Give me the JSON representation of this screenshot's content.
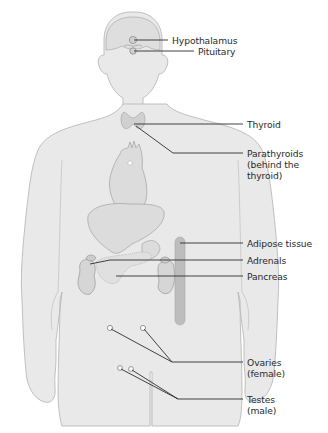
{
  "diagram": {
    "type": "anatomical-diagram",
    "colors": {
      "background": "#ffffff",
      "body_fill": "#e9e9e9",
      "body_stroke": "#b9b9b9",
      "organ_fill": "#d7d7d7",
      "organ_stroke": "#a5a5a5",
      "gland_fill": "#cfcfcf",
      "adipose_fill": "#bdbdbd",
      "leader_line": "#2e2e2e",
      "label_text": "#2a2a2a"
    },
    "labels": [
      {
        "id": "hypothalamus",
        "text": "Hypothalamus"
      },
      {
        "id": "pituitary",
        "text": "Pituitary"
      },
      {
        "id": "thyroid",
        "text": "Thyroid"
      },
      {
        "id": "parathyroids",
        "line1": "Parathyroids",
        "line2": "(behind the",
        "line3": "thyroid)"
      },
      {
        "id": "adipose",
        "text": "Adipose tissue"
      },
      {
        "id": "adrenals",
        "text": "Adrenals"
      },
      {
        "id": "pancreas",
        "text": "Pancreas"
      },
      {
        "id": "ovaries",
        "line1": "Ovaries",
        "line2": "(female)"
      },
      {
        "id": "testes",
        "line1": "Testes",
        "line2": "(male)"
      }
    ]
  }
}
